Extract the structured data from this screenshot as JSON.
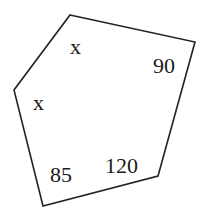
{
  "diagram": {
    "shape": "pentagon",
    "stroke_color": "#222222",
    "vertices": [
      [
        70,
        15
      ],
      [
        195,
        42
      ],
      [
        158,
        176
      ],
      [
        43,
        206
      ],
      [
        14,
        90
      ]
    ],
    "angles": [
      {
        "vertex": "top",
        "label": "x",
        "pos": [
          77,
          52
        ],
        "size": 22
      },
      {
        "vertex": "top-right",
        "label": "90",
        "pos": [
          153,
          73
        ],
        "size": 22
      },
      {
        "vertex": "bottom-right",
        "label": "120",
        "pos": [
          105,
          173
        ],
        "size": 22
      },
      {
        "vertex": "bottom-left",
        "label": "85",
        "pos": [
          50,
          182
        ],
        "size": 22
      },
      {
        "vertex": "left",
        "label": "x",
        "pos": [
          35,
          110
        ],
        "size": 22
      }
    ]
  }
}
